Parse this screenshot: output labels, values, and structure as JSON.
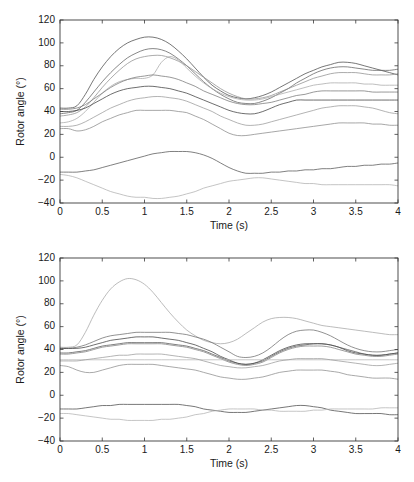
{
  "figure": {
    "background": "#ffffff",
    "panel_count": 2
  },
  "chart_data": [
    {
      "id": "top",
      "type": "line",
      "title": "",
      "xlabel": "Time (s)",
      "ylabel": "Rotor angle (°)",
      "xlim": [
        0,
        4
      ],
      "ylim": [
        -40,
        120
      ],
      "xticks": [
        0,
        0.5,
        1,
        1.5,
        2,
        2.5,
        3,
        3.5,
        4
      ],
      "xticklabels": [
        "0",
        "0.5",
        "1",
        "1.5",
        "2",
        "2.5",
        "3",
        "3.5",
        "4"
      ],
      "yticks": [
        -40,
        -20,
        0,
        20,
        40,
        60,
        80,
        100,
        120
      ],
      "yticklabels": [
        "−40",
        "−20",
        "0",
        "20",
        "40",
        "60",
        "80",
        "100",
        "120"
      ],
      "grid": false,
      "legend": null,
      "box": true,
      "x": [
        0,
        0.1,
        0.2,
        0.3,
        0.4,
        0.5,
        0.6,
        0.7,
        0.8,
        0.9,
        1.0,
        1.1,
        1.2,
        1.3,
        1.4,
        1.5,
        1.6,
        1.7,
        1.8,
        1.9,
        2.0,
        2.1,
        2.2,
        2.3,
        2.4,
        2.5,
        2.6,
        2.7,
        2.8,
        2.9,
        3.0,
        3.1,
        3.2,
        3.3,
        3.4,
        3.5,
        3.6,
        3.7,
        3.8,
        3.9,
        4.0
      ],
      "series": [
        {
          "name": "gen-1",
          "color": "#4a4a4a",
          "values": [
            43,
            43,
            45,
            55,
            68,
            79,
            88,
            95,
            100,
            103,
            105,
            105,
            103,
            99,
            93,
            86,
            78,
            70,
            63,
            58,
            54,
            52,
            51,
            52,
            54,
            57,
            61,
            65,
            69,
            73,
            76,
            79,
            81,
            83,
            83,
            82,
            80,
            78,
            76,
            74,
            72
          ]
        },
        {
          "name": "gen-2",
          "color": "#606060",
          "values": [
            38,
            39,
            41,
            48,
            57,
            66,
            74,
            81,
            87,
            91,
            94,
            95,
            94,
            91,
            86,
            80,
            73,
            66,
            60,
            55,
            51,
            48,
            47,
            47,
            49,
            52,
            56,
            60,
            65,
            69,
            73,
            76,
            78,
            79,
            79,
            78,
            77,
            76,
            76,
            76,
            77
          ]
        },
        {
          "name": "gen-3",
          "color": "#8f8f8f",
          "values": [
            36,
            37,
            39,
            44,
            52,
            61,
            69,
            76,
            82,
            86,
            88,
            89,
            89,
            87,
            84,
            80,
            75,
            70,
            65,
            60,
            56,
            53,
            51,
            51,
            52,
            54,
            57,
            60,
            63,
            66,
            69,
            71,
            73,
            74,
            74,
            74,
            73,
            72,
            72,
            72,
            73
          ]
        },
        {
          "name": "gen-4",
          "color": "#a8a8a8",
          "values": [
            30,
            31,
            34,
            40,
            48,
            56,
            62,
            66,
            68,
            69,
            69,
            72,
            83,
            88,
            85,
            78,
            71,
            65,
            60,
            56,
            53,
            51,
            50,
            50,
            51,
            53,
            55,
            57,
            59,
            61,
            63,
            64,
            65,
            65,
            65,
            65,
            64,
            64,
            63,
            63,
            63
          ]
        },
        {
          "name": "gen-5",
          "color": "#777777",
          "values": [
            42,
            42,
            43,
            46,
            51,
            56,
            61,
            65,
            68,
            70,
            71,
            72,
            71,
            70,
            68,
            65,
            62,
            58,
            55,
            52,
            49,
            47,
            46,
            46,
            47,
            48,
            50,
            52,
            54,
            55,
            57,
            58,
            58,
            58,
            58,
            58,
            58,
            57,
            57,
            57,
            57
          ]
        },
        {
          "name": "gen-6",
          "color": "#3d3d3d",
          "values": [
            40,
            40,
            41,
            43,
            47,
            51,
            55,
            58,
            60,
            61,
            62,
            62,
            61,
            60,
            58,
            56,
            53,
            50,
            47,
            44,
            41,
            39,
            38,
            38,
            40,
            43,
            46,
            48,
            50,
            50,
            50,
            50,
            50,
            50,
            50,
            50,
            50,
            50,
            50,
            50,
            50
          ]
        },
        {
          "name": "gen-7",
          "color": "#9a9a9a",
          "values": [
            27,
            27,
            28,
            31,
            35,
            39,
            43,
            46,
            49,
            51,
            52,
            53,
            53,
            52,
            51,
            49,
            46,
            43,
            40,
            36,
            33,
            30,
            28,
            28,
            29,
            31,
            33,
            35,
            37,
            39,
            41,
            43,
            44,
            45,
            45,
            45,
            44,
            43,
            41,
            39,
            38
          ]
        },
        {
          "name": "gen-8",
          "color": "#8a8a8a",
          "values": [
            25,
            25,
            23,
            24,
            27,
            31,
            34,
            37,
            39,
            41,
            41,
            41,
            41,
            41,
            40,
            39,
            36,
            33,
            29,
            25,
            21,
            19,
            19,
            20,
            21,
            22,
            23,
            24,
            25,
            26,
            27,
            28,
            29,
            30,
            30,
            30,
            30,
            29,
            29,
            28,
            28
          ]
        },
        {
          "name": "gen-9",
          "color": "#555555",
          "values": [
            -13,
            -13,
            -13,
            -12,
            -11,
            -9,
            -7,
            -5,
            -3,
            -1,
            1,
            3,
            4,
            5,
            5,
            5,
            4,
            2,
            -1,
            -5,
            -9,
            -12,
            -14,
            -14,
            -14,
            -13,
            -13,
            -12,
            -12,
            -11,
            -11,
            -10,
            -10,
            -9,
            -8,
            -8,
            -7,
            -7,
            -6,
            -6,
            -5
          ]
        },
        {
          "name": "gen-10",
          "color": "#b0b0b0",
          "values": [
            -15,
            -16,
            -18,
            -21,
            -24,
            -27,
            -30,
            -32,
            -34,
            -35,
            -35,
            -36,
            -36,
            -35,
            -34,
            -32,
            -30,
            -27,
            -25,
            -23,
            -21,
            -20,
            -19,
            -18,
            -18,
            -19,
            -20,
            -21,
            -22,
            -23,
            -23,
            -24,
            -24,
            -24,
            -24,
            -24,
            -24,
            -24,
            -24,
            -24,
            -25
          ]
        }
      ]
    },
    {
      "id": "bottom",
      "type": "line",
      "title": "",
      "xlabel": "Time (s)",
      "ylabel": "Rotor angle (°)",
      "xlim": [
        0,
        4
      ],
      "ylim": [
        -40,
        120
      ],
      "xticks": [
        0,
        0.5,
        1,
        1.5,
        2,
        2.5,
        3,
        3.5,
        4
      ],
      "xticklabels": [
        "0",
        "0.5",
        "1",
        "1.5",
        "2",
        "2.5",
        "3",
        "3.5",
        "4"
      ],
      "yticks": [
        -40,
        -20,
        0,
        20,
        40,
        60,
        80,
        100,
        120
      ],
      "yticklabels": [
        "−40",
        "−20",
        "0",
        "20",
        "40",
        "60",
        "80",
        "100",
        "120"
      ],
      "grid": false,
      "legend": null,
      "box": true,
      "x": [
        0,
        0.1,
        0.2,
        0.3,
        0.4,
        0.5,
        0.6,
        0.7,
        0.8,
        0.9,
        1.0,
        1.1,
        1.2,
        1.3,
        1.4,
        1.5,
        1.6,
        1.7,
        1.8,
        1.9,
        2.0,
        2.1,
        2.2,
        2.3,
        2.4,
        2.5,
        2.6,
        2.7,
        2.8,
        2.9,
        3.0,
        3.1,
        3.2,
        3.3,
        3.4,
        3.5,
        3.6,
        3.7,
        3.8,
        3.9,
        4.0
      ],
      "series": [
        {
          "name": "gen-1",
          "color": "#a5a5a5",
          "values": [
            42,
            42,
            44,
            55,
            70,
            83,
            93,
            99,
            102,
            101,
            97,
            90,
            81,
            72,
            64,
            57,
            52,
            48,
            46,
            45,
            46,
            49,
            54,
            59,
            64,
            67,
            68,
            68,
            67,
            65,
            63,
            61,
            60,
            59,
            58,
            57,
            56,
            55,
            54,
            53,
            53
          ]
        },
        {
          "name": "gen-2",
          "color": "#6e6e6e",
          "values": [
            41,
            41,
            42,
            44,
            47,
            50,
            52,
            53,
            54,
            55,
            55,
            55,
            55,
            55,
            54,
            53,
            51,
            49,
            46,
            42,
            38,
            34,
            33,
            34,
            37,
            42,
            48,
            53,
            56,
            57,
            57,
            55,
            52,
            48,
            44,
            41,
            39,
            38,
            38,
            39,
            40
          ]
        },
        {
          "name": "gen-3",
          "color": "#3f3f3f",
          "values": [
            41,
            41,
            41,
            42,
            44,
            46,
            48,
            49,
            50,
            51,
            51,
            51,
            50,
            49,
            48,
            46,
            44,
            41,
            38,
            34,
            31,
            28,
            27,
            28,
            31,
            35,
            39,
            42,
            44,
            45,
            45,
            45,
            44,
            42,
            39,
            37,
            36,
            35,
            35,
            36,
            37
          ]
        },
        {
          "name": "gen-4",
          "color": "#555555",
          "values": [
            37,
            37,
            38,
            39,
            41,
            43,
            44,
            45,
            46,
            46,
            46,
            46,
            46,
            45,
            44,
            43,
            41,
            39,
            36,
            33,
            30,
            28,
            27,
            28,
            30,
            34,
            38,
            41,
            43,
            44,
            45,
            45,
            44,
            42,
            40,
            38,
            36,
            35,
            35,
            36,
            37
          ]
        },
        {
          "name": "gen-5",
          "color": "#7d7d7d",
          "values": [
            36,
            36,
            37,
            38,
            40,
            42,
            43,
            44,
            45,
            45,
            45,
            45,
            45,
            44,
            43,
            42,
            40,
            38,
            35,
            32,
            29,
            27,
            26,
            27,
            29,
            33,
            37,
            40,
            42,
            43,
            43,
            43,
            42,
            40,
            38,
            36,
            35,
            34,
            34,
            35,
            36
          ]
        },
        {
          "name": "gen-6",
          "color": "#b4b4b4",
          "values": [
            31,
            31,
            31,
            31,
            31,
            31,
            31,
            31,
            31,
            31,
            31,
            31,
            31,
            31,
            31,
            31,
            31,
            31,
            31,
            31,
            31,
            31,
            31,
            31,
            31,
            31,
            31,
            31,
            31,
            31,
            31,
            31,
            31,
            31,
            31,
            31,
            31,
            31,
            31,
            31,
            31
          ]
        },
        {
          "name": "gen-7",
          "color": "#9b9b9b",
          "values": [
            30,
            30,
            30,
            31,
            32,
            33,
            34,
            35,
            35,
            36,
            36,
            36,
            36,
            35,
            34,
            33,
            32,
            30,
            28,
            26,
            25,
            24,
            24,
            25,
            26,
            28,
            30,
            31,
            32,
            32,
            32,
            32,
            31,
            30,
            29,
            28,
            27,
            26,
            26,
            27,
            28
          ]
        },
        {
          "name": "gen-8",
          "color": "#8c8c8c",
          "values": [
            26,
            25,
            22,
            20,
            20,
            22,
            24,
            26,
            27,
            27,
            27,
            27,
            26,
            25,
            24,
            23,
            22,
            20,
            18,
            16,
            15,
            14,
            14,
            15,
            16,
            18,
            20,
            21,
            22,
            22,
            22,
            22,
            21,
            20,
            18,
            17,
            16,
            15,
            15,
            15,
            14
          ]
        },
        {
          "name": "gen-9",
          "color": "#4a4a4a",
          "values": [
            -12,
            -12,
            -12,
            -11,
            -10,
            -9,
            -9,
            -8,
            -8,
            -8,
            -8,
            -8,
            -8,
            -8,
            -8,
            -9,
            -10,
            -12,
            -13,
            -14,
            -15,
            -15,
            -15,
            -14,
            -13,
            -12,
            -11,
            -10,
            -9,
            -9,
            -10,
            -11,
            -13,
            -14,
            -15,
            -16,
            -16,
            -16,
            -16,
            -17,
            -17
          ]
        },
        {
          "name": "gen-10",
          "color": "#b2b2b2",
          "values": [
            -16,
            -16,
            -17,
            -18,
            -19,
            -20,
            -21,
            -21,
            -22,
            -22,
            -22,
            -22,
            -21,
            -21,
            -20,
            -19,
            -17,
            -16,
            -14,
            -13,
            -12,
            -12,
            -12,
            -12,
            -13,
            -13,
            -14,
            -14,
            -14,
            -14,
            -13,
            -13,
            -12,
            -12,
            -12,
            -12,
            -12,
            -12,
            -11,
            -11,
            -11
          ]
        }
      ]
    }
  ]
}
